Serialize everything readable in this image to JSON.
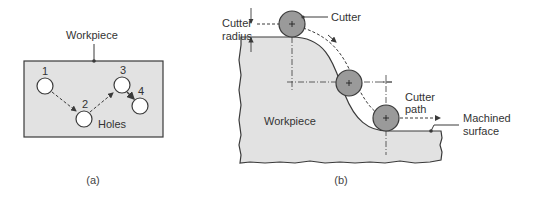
{
  "colors": {
    "workpiece_fill": "#e2e2e2",
    "cutter_fill": "#9a9a9a",
    "stroke": "#3a3a3a",
    "background": "#ffffff"
  },
  "panel_a": {
    "label_workpiece": "Workpiece",
    "label_holes": "Holes",
    "holes": [
      {
        "id": "1",
        "label": "1"
      },
      {
        "id": "2",
        "label": "2"
      },
      {
        "id": "3",
        "label": "3"
      },
      {
        "id": "4",
        "label": "4"
      }
    ],
    "caption": "(a)"
  },
  "panel_b": {
    "label_cutter": "Cutter",
    "label_cutter_radius_line1": "Cutter",
    "label_cutter_radius_line2": "radius",
    "label_workpiece": "Workpiece",
    "label_cutter_path_line1": "Cutter",
    "label_cutter_path_line2": "path",
    "label_machined_surface_line1": "Machined",
    "label_machined_surface_line2": "surface",
    "caption": "(b)"
  }
}
